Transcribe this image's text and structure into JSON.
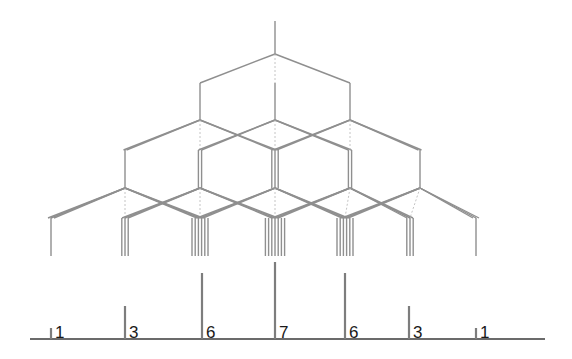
{
  "diagram": {
    "title": "",
    "type": "splitting-tree",
    "colors": {
      "tree": "#8f8f8f",
      "sticks": "#7d7d7d",
      "baseline": "#3a3a3a",
      "labels": "#1a1a1a"
    },
    "root": {
      "x": 275,
      "top": 21,
      "split_y": 54
    },
    "levels": [
      {
        "from_y": 54,
        "to_y": 83,
        "end_y": 120,
        "x": [
          200,
          275,
          350
        ]
      },
      {
        "from_y": 120,
        "to_y": 150,
        "end_y": 188,
        "x": [
          125,
          200,
          275,
          350,
          420
        ]
      },
      {
        "from_y": 188,
        "to_y": 218,
        "end_y": 256,
        "x": [
          51,
          125,
          200,
          275,
          345,
          410,
          476
        ]
      }
    ],
    "spectrum": {
      "baseline": {
        "y": 339,
        "x1": 30,
        "x2": 545
      },
      "peaks": [
        {
          "x": 51,
          "intensity": 1,
          "label": "1"
        },
        {
          "x": 125,
          "intensity": 3,
          "label": "3"
        },
        {
          "x": 202,
          "intensity": 6,
          "label": "6"
        },
        {
          "x": 275,
          "intensity": 7,
          "label": "7"
        },
        {
          "x": 345,
          "intensity": 6,
          "label": "6"
        },
        {
          "x": 409,
          "intensity": 3,
          "label": "3"
        },
        {
          "x": 476,
          "intensity": 1,
          "label": "1"
        }
      ]
    }
  }
}
